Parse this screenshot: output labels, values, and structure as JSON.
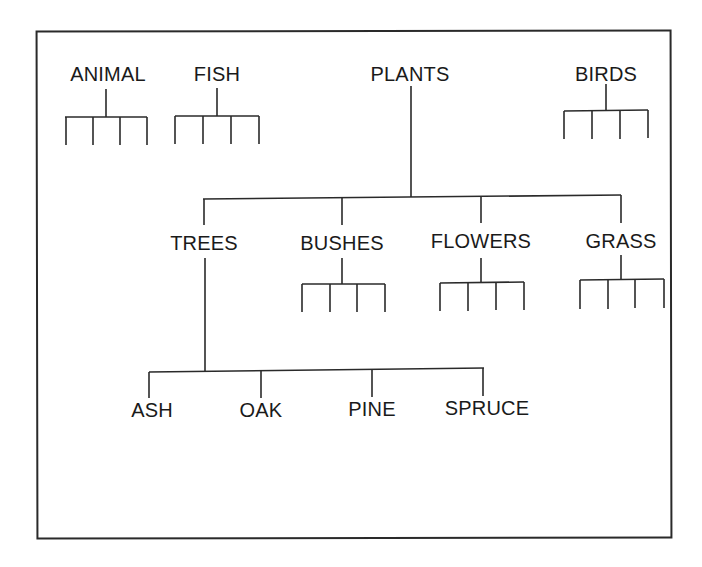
{
  "diagram": {
    "type": "hierarchy-tree",
    "top_level": [
      {
        "id": "animal",
        "label": "ANIMAL",
        "x": 108,
        "y": 64,
        "stub_children": 4
      },
      {
        "id": "fish",
        "label": "FISH",
        "x": 217,
        "y": 64,
        "stub_children": 4
      },
      {
        "id": "plants",
        "label": "PLANTS",
        "x": 410,
        "y": 64,
        "stub_children": 0
      },
      {
        "id": "birds",
        "label": "BIRDS",
        "x": 606,
        "y": 64,
        "stub_children": 4
      }
    ],
    "plants_children": [
      {
        "id": "trees",
        "label": "TREES",
        "x": 204,
        "y": 233,
        "stub_children": 0
      },
      {
        "id": "bushes",
        "label": "BUSHES",
        "x": 342,
        "y": 233,
        "stub_children": 4
      },
      {
        "id": "flowers",
        "label": "FLOWERS",
        "x": 481,
        "y": 231,
        "stub_children": 4
      },
      {
        "id": "grass",
        "label": "GRASS",
        "x": 621,
        "y": 231,
        "stub_children": 4
      }
    ],
    "trees_children": [
      {
        "id": "ash",
        "label": "ASH",
        "x": 152,
        "y": 400
      },
      {
        "id": "oak",
        "label": "OAK",
        "x": 261,
        "y": 400
      },
      {
        "id": "pine",
        "label": "PINE",
        "x": 372,
        "y": 399
      },
      {
        "id": "spruce",
        "label": "SPRUCE",
        "x": 487,
        "y": 398
      }
    ],
    "line_color": "#2a2a2a",
    "text_color": "#1a1a1a",
    "background": "#ffffff"
  }
}
